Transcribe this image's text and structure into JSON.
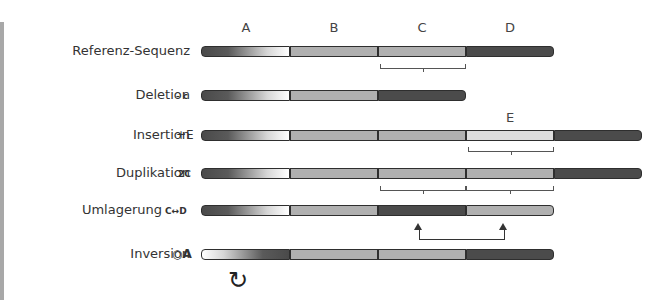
{
  "column_labels": [
    "A",
    "B",
    "C",
    "D"
  ],
  "rows": [
    {
      "label": "Referenz-Sequenz",
      "op": ""
    },
    {
      "label": "Deletion",
      "op": "- c"
    },
    {
      "label": "Insertion",
      "op": "+E"
    },
    {
      "label": "Duplikation",
      "op": "2C"
    },
    {
      "label": "Umlagerung",
      "op": "C↔D"
    },
    {
      "label": "Inversion",
      "op": "○A"
    }
  ],
  "extra_label": "E",
  "rotate_symbol": "↻",
  "colors": {
    "segment_dark": "#4b4b4b",
    "segment_mid": "#b0b0b0",
    "segment_light": "#dedede",
    "outline": "#2e2e2e"
  }
}
